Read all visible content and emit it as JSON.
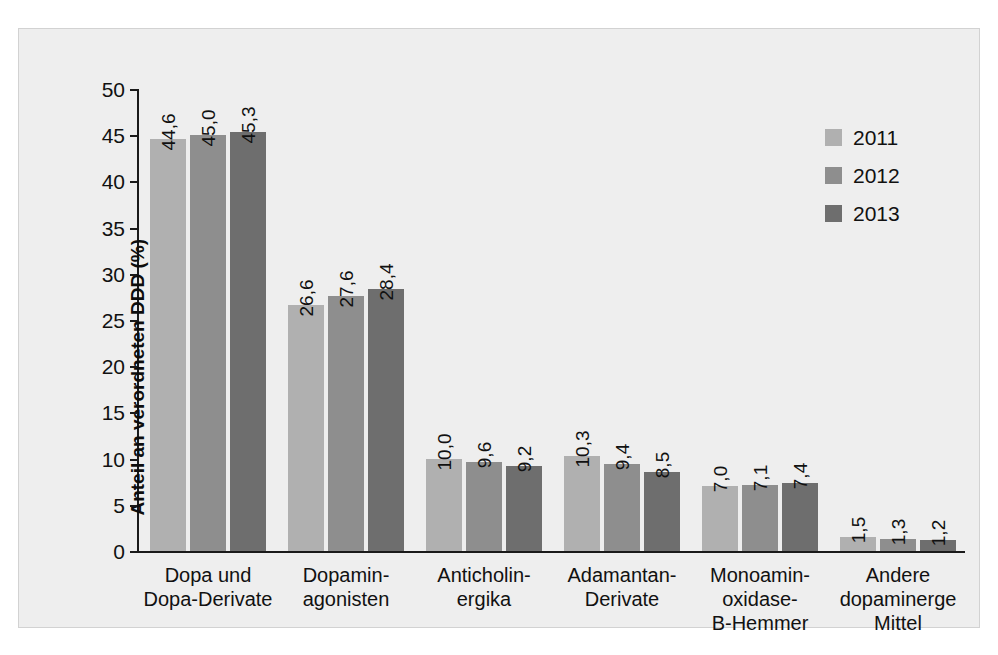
{
  "chart_data": {
    "type": "bar",
    "title": "",
    "subtitle": "",
    "xlabel": "",
    "ylabel": "Anteil an verordneten DDD (%)",
    "ylim": [
      0,
      50
    ],
    "ytick_step": 5,
    "yticks": [
      "0",
      "5",
      "10",
      "15",
      "20",
      "25",
      "30",
      "35",
      "40",
      "45",
      "50"
    ],
    "grid": false,
    "legend_position": "top-right",
    "categories": [
      "Dopa und\nDopa-Derivate",
      "Dopamin-\nagonisten",
      "Anticholin-\nergika",
      "Adamantan-\nDerivate",
      "Monoamin-\noxidase-\nB-Hemmer",
      "Andere\ndopaminerge\nMittel"
    ],
    "category_lines": [
      [
        "Dopa und",
        "Dopa-Derivate"
      ],
      [
        "Dopamin-",
        "agonisten"
      ],
      [
        "Anticholin-",
        "ergika"
      ],
      [
        "Adamantan-",
        "Derivate"
      ],
      [
        "Monoamin-",
        "oxidase-",
        "B-Hemmer"
      ],
      [
        "Andere",
        "dopaminerge",
        "Mittel"
      ]
    ],
    "series": [
      {
        "name": "2011",
        "color": "#b0b0b0",
        "values": [
          44.6,
          26.6,
          10.0,
          10.3,
          7.0,
          1.5
        ],
        "labels": [
          "44,6",
          "26,6",
          "10,0",
          "10,3",
          "7,0",
          "1,5"
        ]
      },
      {
        "name": "2012",
        "color": "#8e8e8e",
        "values": [
          45.0,
          27.6,
          9.6,
          9.4,
          7.1,
          1.3
        ],
        "labels": [
          "45,0",
          "27,6",
          "9,6",
          "9,4",
          "7,1",
          "1,3"
        ]
      },
      {
        "name": "2013",
        "color": "#6e6e6e",
        "values": [
          45.3,
          28.4,
          9.2,
          8.5,
          7.4,
          1.2
        ],
        "labels": [
          "45,3",
          "28,4",
          "9,2",
          "8,5",
          "7,4",
          "1,2"
        ]
      }
    ]
  },
  "legend": {
    "items": [
      {
        "label": "2011",
        "color": "#b0b0b0"
      },
      {
        "label": "2012",
        "color": "#8e8e8e"
      },
      {
        "label": "2013",
        "color": "#6e6e6e"
      }
    ]
  },
  "colors": {
    "panel_background": "#eeeeee",
    "panel_border": "#d2d2d2",
    "axis": "#1a1a1a",
    "text": "#111111",
    "series_2011": "#b0b0b0",
    "series_2012": "#8e8e8e",
    "series_2013": "#6e6e6e"
  }
}
